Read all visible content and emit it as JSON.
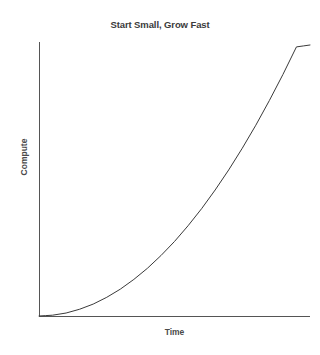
{
  "chart_data": {
    "type": "line",
    "title": "Start Small, Grow Fast",
    "xlabel": "Time",
    "ylabel": "Compute",
    "grid": false,
    "legend": false,
    "xlim": [
      0,
      10
    ],
    "ylim": [
      0,
      10
    ],
    "xticks": [],
    "yticks": [],
    "series": [
      {
        "name": "Compute growth",
        "color": "#3a3a3a",
        "linewidth": 1,
        "x": [
          0,
          0.5,
          1,
          1.5,
          2,
          2.5,
          3,
          3.5,
          4,
          4.5,
          5,
          5.5,
          6,
          6.5,
          7,
          7.5,
          8,
          8.5,
          9,
          9.5,
          10
        ],
        "y": [
          0,
          0.03,
          0.11,
          0.25,
          0.44,
          0.69,
          0.99,
          1.35,
          1.76,
          2.23,
          2.75,
          3.33,
          3.96,
          4.65,
          5.39,
          6.19,
          7.04,
          7.95,
          8.91,
          9.93,
          10.0
        ]
      }
    ]
  },
  "axes": {
    "spine_color": "#555555",
    "background": "#ffffff"
  },
  "caption": {
    "clipped_text": ""
  }
}
